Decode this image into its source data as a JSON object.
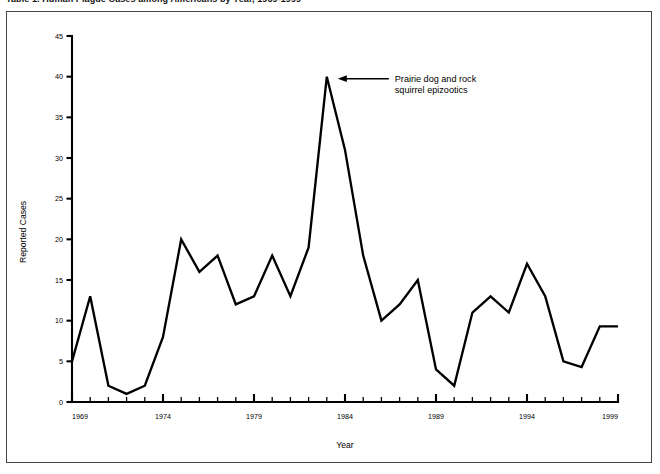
{
  "figure": {
    "title": "Table 1. Human Plague Cases among Americans by Year, 1969-1999",
    "frame_color": "#444444"
  },
  "chart_data": {
    "type": "line",
    "title": "",
    "xlabel": "Year",
    "ylabel": "Reported Cases",
    "xlim": [
      1969,
      1999
    ],
    "ylim": [
      0,
      45
    ],
    "ytick_step": 5,
    "yticks": [
      0,
      5,
      10,
      15,
      20,
      25,
      30,
      35,
      40,
      45
    ],
    "xtick_step": 1,
    "xtick_labels": [
      "1969",
      "1974",
      "1979",
      "1984",
      "1989",
      "1994",
      "1999"
    ],
    "xtick_label_years": [
      1969,
      1974,
      1979,
      1984,
      1989,
      1994,
      1999
    ],
    "grid": false,
    "legend": "none",
    "line_color": "#000000",
    "x": [
      1969,
      1970,
      1971,
      1972,
      1973,
      1974,
      1975,
      1976,
      1977,
      1978,
      1979,
      1980,
      1981,
      1982,
      1983,
      1984,
      1985,
      1986,
      1987,
      1988,
      1989,
      1990,
      1991,
      1992,
      1993,
      1994,
      1995,
      1996,
      1997,
      1998,
      1999
    ],
    "values": [
      5,
      13,
      2,
      1,
      2,
      8,
      20,
      16,
      18,
      12,
      13,
      18,
      13,
      19,
      40,
      31,
      18,
      10,
      12,
      15,
      4,
      2,
      11,
      13,
      11,
      17,
      13,
      5,
      4.3,
      9.3,
      9.3
    ],
    "series": [
      {
        "name": "Reported Cases",
        "values": [
          5,
          13,
          2,
          1,
          2,
          8,
          20,
          16,
          18,
          12,
          13,
          18,
          13,
          19,
          40,
          31,
          18,
          10,
          12,
          15,
          4,
          2,
          11,
          13,
          11,
          17,
          13,
          5,
          4.3,
          9.3,
          9.3
        ]
      }
    ],
    "annotations": [
      {
        "name": "peak-annotation",
        "text_line1": "Prairie dog and rock",
        "text_line2": "squirrel epizootics",
        "points_to_year": 1983,
        "points_to_value": 40
      }
    ]
  }
}
